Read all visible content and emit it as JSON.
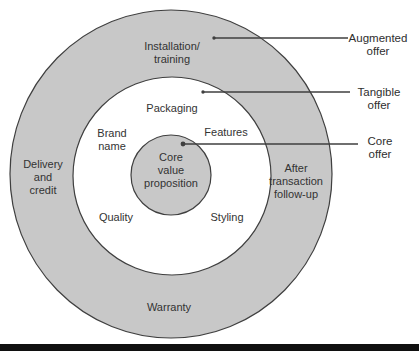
{
  "colors": {
    "ring_fill": "#c8c8c8",
    "white_fill": "#ffffff",
    "stroke": "#3f3f3f",
    "text": "#333333",
    "bar": "#101010"
  },
  "rings": {
    "augmented": {
      "callout": "Augmented\noffer",
      "labels": {
        "top": "Installation/\ntraining",
        "left": "Delivery\nand\ncredit",
        "right": "After\ntransaction\nfollow-up",
        "bottom": "Warranty"
      }
    },
    "tangible": {
      "callout": "Tangible\noffer",
      "labels": {
        "top": "Packaging",
        "upper_left": "Brand\nname",
        "upper_right": "Features",
        "lower_left": "Quality",
        "lower_right": "Styling"
      }
    },
    "core": {
      "callout": "Core\noffer",
      "center_label": "Core\nvalue\nproposition"
    }
  }
}
